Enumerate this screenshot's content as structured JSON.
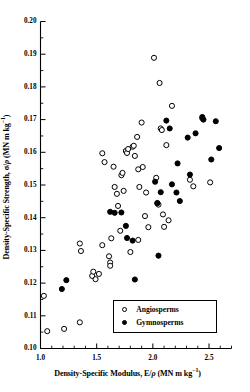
{
  "chart_data": {
    "type": "scatter",
    "title": "",
    "xlabel": "Density-Specific Modulus, E/ρ (MN m kg−1)",
    "ylabel": "Density-Specific Strength, σ/ρ (MN m kg−1)",
    "xlabel_parts": {
      "pre": "Density-Specific Modulus, E/",
      "rho": "ρ",
      "units": " (MN m kg",
      "exp": "−1",
      "post": ")"
    },
    "ylabel_parts": {
      "pre": "Density-Specific Strength, σ/",
      "rho": "ρ",
      "units": " (MN m kg",
      "exp": "−1",
      "post": ")"
    },
    "xlim": [
      1.0,
      2.7
    ],
    "ylim": [
      0.1,
      0.2
    ],
    "xticks": [
      1.0,
      1.5,
      2.0,
      2.5
    ],
    "xtick_labels": [
      "1.0",
      "1.5",
      "2.0",
      "2.5"
    ],
    "xminor_step": 0.1,
    "yticks": [
      0.1,
      0.11,
      0.12,
      0.13,
      0.14,
      0.15,
      0.16,
      0.17,
      0.18,
      0.19,
      0.2
    ],
    "ytick_labels": [
      "0.10",
      "0.11",
      "0.12",
      "0.13",
      "0.14",
      "0.15",
      "0.16",
      "0.17",
      "0.18",
      "0.19",
      "0.20"
    ],
    "yminor_step": 0.005,
    "grid": false,
    "legend_position": "lower-right",
    "series": [
      {
        "name": "Angiosperms",
        "marker": "open-circle",
        "color": "#000000",
        "fill": "#ffffff",
        "points": [
          [
            1.03,
            0.1161
          ],
          [
            1.06,
            0.1053
          ],
          [
            1.21,
            0.106
          ],
          [
            1.35,
            0.108
          ],
          [
            1.35,
            0.1321
          ],
          [
            1.36,
            0.1298
          ],
          [
            1.46,
            0.1222
          ],
          [
            1.47,
            0.1235
          ],
          [
            1.49,
            0.1212
          ],
          [
            1.52,
            0.1228
          ],
          [
            1.55,
            0.1316
          ],
          [
            1.55,
            0.1597
          ],
          [
            1.57,
            0.157
          ],
          [
            1.61,
            0.1282
          ],
          [
            1.62,
            0.1263
          ],
          [
            1.62,
            0.1253
          ],
          [
            1.63,
            0.1337
          ],
          [
            1.65,
            0.1556
          ],
          [
            1.66,
            0.1494
          ],
          [
            1.68,
            0.1473
          ],
          [
            1.69,
            0.1436
          ],
          [
            1.71,
            0.136
          ],
          [
            1.72,
            0.153
          ],
          [
            1.73,
            0.1537
          ],
          [
            1.74,
            0.1482
          ],
          [
            1.76,
            0.1604
          ],
          [
            1.77,
            0.1598
          ],
          [
            1.78,
            0.161
          ],
          [
            1.8,
            0.1295
          ],
          [
            1.82,
            0.1617
          ],
          [
            1.83,
            0.162
          ],
          [
            1.84,
            0.1589
          ],
          [
            1.86,
            0.1647
          ],
          [
            1.87,
            0.1332
          ],
          [
            1.87,
            0.1548
          ],
          [
            1.88,
            0.1494
          ],
          [
            1.9,
            0.1691
          ],
          [
            1.91,
            0.1555
          ],
          [
            1.93,
            0.1405
          ],
          [
            1.94,
            0.1477
          ],
          [
            1.96,
            0.1371
          ],
          [
            2.01,
            0.1889
          ],
          [
            2.03,
            0.1522
          ],
          [
            2.04,
            0.1445
          ],
          [
            2.05,
            0.144
          ],
          [
            2.06,
            0.1812
          ],
          [
            2.07,
            0.1673
          ],
          [
            2.08,
            0.1668
          ],
          [
            2.09,
            0.141
          ],
          [
            2.1,
            0.1372
          ],
          [
            2.12,
            0.1622
          ],
          [
            2.14,
            0.1392
          ],
          [
            2.17,
            0.1742
          ],
          [
            2.33,
            0.1516
          ],
          [
            2.36,
            0.1496
          ],
          [
            2.44,
            0.1704
          ],
          [
            2.51,
            0.1508
          ]
        ]
      },
      {
        "name": "Gymnosperms",
        "marker": "filled-circle",
        "color": "#000000",
        "fill": "#000000",
        "points": [
          [
            1.19,
            0.1182
          ],
          [
            1.23,
            0.1209
          ],
          [
            1.62,
            0.1418
          ],
          [
            1.66,
            0.1415
          ],
          [
            1.72,
            0.1416
          ],
          [
            1.76,
            0.1375
          ],
          [
            1.77,
            0.1338
          ],
          [
            1.82,
            0.133
          ],
          [
            1.84,
            0.1211
          ],
          [
            2.02,
            0.151
          ],
          [
            2.04,
            0.1444
          ],
          [
            2.05,
            0.1284
          ],
          [
            2.07,
            0.1478
          ],
          [
            2.12,
            0.1697
          ],
          [
            2.15,
            0.1673
          ],
          [
            2.17,
            0.1502
          ],
          [
            2.21,
            0.1477
          ],
          [
            2.22,
            0.1566
          ],
          [
            2.24,
            0.1451
          ],
          [
            2.31,
            0.1645
          ],
          [
            2.33,
            0.1532
          ],
          [
            2.38,
            0.1658
          ],
          [
            2.44,
            0.1708
          ],
          [
            2.45,
            0.17
          ],
          [
            2.52,
            0.1578
          ],
          [
            2.56,
            0.1695
          ],
          [
            2.59,
            0.1613
          ]
        ]
      }
    ],
    "legend": [
      {
        "label": "Angiosperms",
        "marker": "open-circle"
      },
      {
        "label": "Gymnosperms",
        "marker": "filled-circle"
      }
    ]
  }
}
